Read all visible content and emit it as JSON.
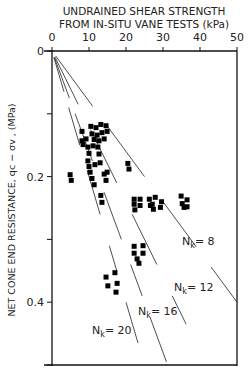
{
  "chart_data": {
    "type": "scatter",
    "title": "",
    "xlabel_line1": "UNDRAINED SHEAR STRENGTH",
    "xlabel_line2": "FROM IN-SITU VANE TESTS (kPa)",
    "ylabel": "NET CONE END RESISTANCE, qc − σv , (MPa)",
    "x_axis_position": "top",
    "xlim": [
      0,
      50
    ],
    "ylim": [
      0,
      0.5
    ],
    "y_inverted": true,
    "xticks": [
      0,
      10,
      20,
      30,
      40,
      50
    ],
    "xtick_labels": [
      "0",
      "10",
      "20",
      "30",
      "40",
      "50"
    ],
    "yticks": [
      0,
      0.1,
      0.2,
      0.3,
      0.4,
      0.5
    ],
    "ytick_labels": [
      "0",
      "",
      "0.2",
      "",
      "0.4",
      ""
    ],
    "grid": false,
    "reference_lines": [
      {
        "name": "Nk = 8",
        "label_main": "N",
        "label_sub": "k",
        "label_rest": "= 8",
        "Nk": 8
      },
      {
        "name": "Nk = 12",
        "label_main": "N",
        "label_sub": "k",
        "label_rest": "= 12",
        "Nk": 12
      },
      {
        "name": "Nk = 16",
        "label_main": "N",
        "label_sub": "k",
        "label_rest": "= 16",
        "Nk": 16
      },
      {
        "name": "Nk = 20",
        "label_main": "N",
        "label_sub": "k",
        "label_rest": "= 20",
        "Nk": 20
      }
    ],
    "series": [
      {
        "name": "Field data",
        "marker": "square",
        "points": [
          [
            8.1,
            0.128
          ],
          [
            10.5,
            0.12
          ],
          [
            11.9,
            0.122
          ],
          [
            13.2,
            0.117
          ],
          [
            14.6,
            0.119
          ],
          [
            10.8,
            0.132
          ],
          [
            12.2,
            0.134
          ],
          [
            13.5,
            0.13
          ],
          [
            14.9,
            0.128
          ],
          [
            9.2,
            0.14
          ],
          [
            11.4,
            0.141
          ],
          [
            12.7,
            0.143
          ],
          [
            14.1,
            0.14
          ],
          [
            8.1,
            0.143
          ],
          [
            8.4,
            0.149
          ],
          [
            9.7,
            0.153
          ],
          [
            11.1,
            0.151
          ],
          [
            12.4,
            0.153
          ],
          [
            10.0,
            0.163
          ],
          [
            12.7,
            0.164
          ],
          [
            9.7,
            0.175
          ],
          [
            10.0,
            0.184
          ],
          [
            11.6,
            0.181
          ],
          [
            13.0,
            0.178
          ],
          [
            20.5,
            0.179
          ],
          [
            20.8,
            0.188
          ],
          [
            4.9,
            0.197
          ],
          [
            5.2,
            0.206
          ],
          [
            10.3,
            0.193
          ],
          [
            10.8,
            0.203
          ],
          [
            11.4,
            0.213
          ],
          [
            14.1,
            0.196
          ],
          [
            14.6,
            0.206
          ],
          [
            14.9,
            0.193
          ],
          [
            13.2,
            0.23
          ],
          [
            13.5,
            0.241
          ],
          [
            22.2,
            0.236
          ],
          [
            22.2,
            0.244
          ],
          [
            22.4,
            0.253
          ],
          [
            23.8,
            0.236
          ],
          [
            23.8,
            0.246
          ],
          [
            26.3,
            0.236
          ],
          [
            26.6,
            0.246
          ],
          [
            27.1,
            0.244
          ],
          [
            27.4,
            0.252
          ],
          [
            27.9,
            0.233
          ],
          [
            29.3,
            0.249
          ],
          [
            29.6,
            0.24
          ],
          [
            34.9,
            0.231
          ],
          [
            35.2,
            0.243
          ],
          [
            35.7,
            0.249
          ],
          [
            36.5,
            0.237
          ],
          [
            36.5,
            0.248
          ],
          [
            22.2,
            0.311
          ],
          [
            22.2,
            0.322
          ],
          [
            24.6,
            0.31
          ],
          [
            24.6,
            0.322
          ],
          [
            23.0,
            0.331
          ],
          [
            23.5,
            0.338
          ],
          [
            14.6,
            0.36
          ],
          [
            15.1,
            0.374
          ],
          [
            17.0,
            0.353
          ],
          [
            17.6,
            0.37
          ],
          [
            17.3,
            0.384
          ]
        ]
      }
    ]
  }
}
